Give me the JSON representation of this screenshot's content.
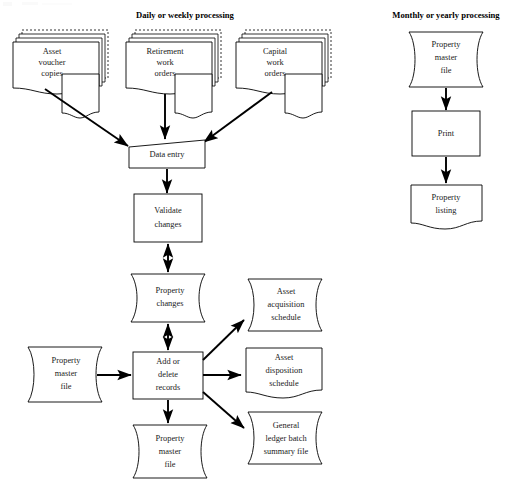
{
  "diagram": {
    "background_color": "#ffffff",
    "line_color": "#000000",
    "text_color": "#1a1a1a",
    "width": 513,
    "height": 485
  },
  "sections": [
    {
      "id": "daily",
      "title": "Daily or weekly processing"
    },
    {
      "id": "monthly",
      "title": "Monthly or yearly processing"
    }
  ],
  "nodes": {
    "asset_voucher_copies": {
      "shape": "stacked-document",
      "lines": [
        "Asset",
        "voucher",
        "copies"
      ]
    },
    "retirement_work_orders": {
      "shape": "stacked-document",
      "lines": [
        "Retirement",
        "work",
        "orders"
      ]
    },
    "capital_work_orders": {
      "shape": "stacked-document",
      "lines": [
        "Capital",
        "work",
        "orders"
      ]
    },
    "data_entry": {
      "shape": "manual-input-trapezoid",
      "lines": [
        "Data entry"
      ]
    },
    "validate_changes": {
      "shape": "process-rectangle",
      "lines": [
        "Validate",
        "changes"
      ]
    },
    "property_changes": {
      "shape": "magnetic-disk",
      "lines": [
        "Property",
        "changes"
      ]
    },
    "property_master_file_input": {
      "shape": "magnetic-disk",
      "lines": [
        "Property",
        "master",
        "file"
      ]
    },
    "add_or_delete_records": {
      "shape": "process-rectangle",
      "lines": [
        "Add or",
        "delete",
        "records"
      ]
    },
    "asset_acquisition_schedule": {
      "shape": "magnetic-disk",
      "lines": [
        "Asset",
        "acquisition",
        "schedule"
      ]
    },
    "asset_disposition_schedule": {
      "shape": "document",
      "lines": [
        "Asset",
        "disposition",
        "schedule"
      ]
    },
    "general_ledger_batch_summary_file": {
      "shape": "magnetic-disk",
      "lines": [
        "General",
        "ledger batch",
        "summary file"
      ]
    },
    "property_master_file_output": {
      "shape": "magnetic-disk",
      "lines": [
        "Property",
        "master",
        "file"
      ]
    },
    "property_master_file_monthly": {
      "shape": "magnetic-disk",
      "lines": [
        "Property",
        "master",
        "file"
      ]
    },
    "print": {
      "shape": "process-rectangle",
      "lines": [
        "Print"
      ]
    },
    "property_listing": {
      "shape": "document",
      "lines": [
        "Property",
        "listing"
      ]
    }
  },
  "connectors": [
    {
      "id": "voucher-to-dataentry",
      "from": "asset_voucher_copies",
      "to": "data_entry",
      "style": "single-arrow"
    },
    {
      "id": "retirement-to-dataentry",
      "from": "retirement_work_orders",
      "to": "data_entry",
      "style": "single-arrow"
    },
    {
      "id": "capital-to-dataentry",
      "from": "capital_work_orders",
      "to": "data_entry",
      "style": "single-arrow"
    },
    {
      "id": "dataentry-to-validate",
      "from": "data_entry",
      "to": "validate_changes",
      "style": "single-arrow"
    },
    {
      "id": "validate-to-changes",
      "from": "validate_changes",
      "to": "property_changes",
      "style": "double-arrow"
    },
    {
      "id": "changes-to-addelete",
      "from": "property_changes",
      "to": "add_or_delete_records",
      "style": "double-arrow"
    },
    {
      "id": "master-to-addelete",
      "from": "property_master_file_input",
      "to": "add_or_delete_records",
      "style": "single-arrow"
    },
    {
      "id": "addelete-to-acquisition",
      "from": "add_or_delete_records",
      "to": "asset_acquisition_schedule",
      "style": "single-arrow"
    },
    {
      "id": "addelete-to-disposition",
      "from": "add_or_delete_records",
      "to": "asset_disposition_schedule",
      "style": "single-arrow"
    },
    {
      "id": "addelete-to-gl",
      "from": "add_or_delete_records",
      "to": "general_ledger_batch_summary_file",
      "style": "single-arrow"
    },
    {
      "id": "addelete-to-master-out",
      "from": "add_or_delete_records",
      "to": "property_master_file_output",
      "style": "single-arrow"
    },
    {
      "id": "master-monthly-to-print",
      "from": "property_master_file_monthly",
      "to": "print",
      "style": "single-arrow"
    },
    {
      "id": "print-to-listing",
      "from": "print",
      "to": "property_listing",
      "style": "single-arrow"
    }
  ]
}
